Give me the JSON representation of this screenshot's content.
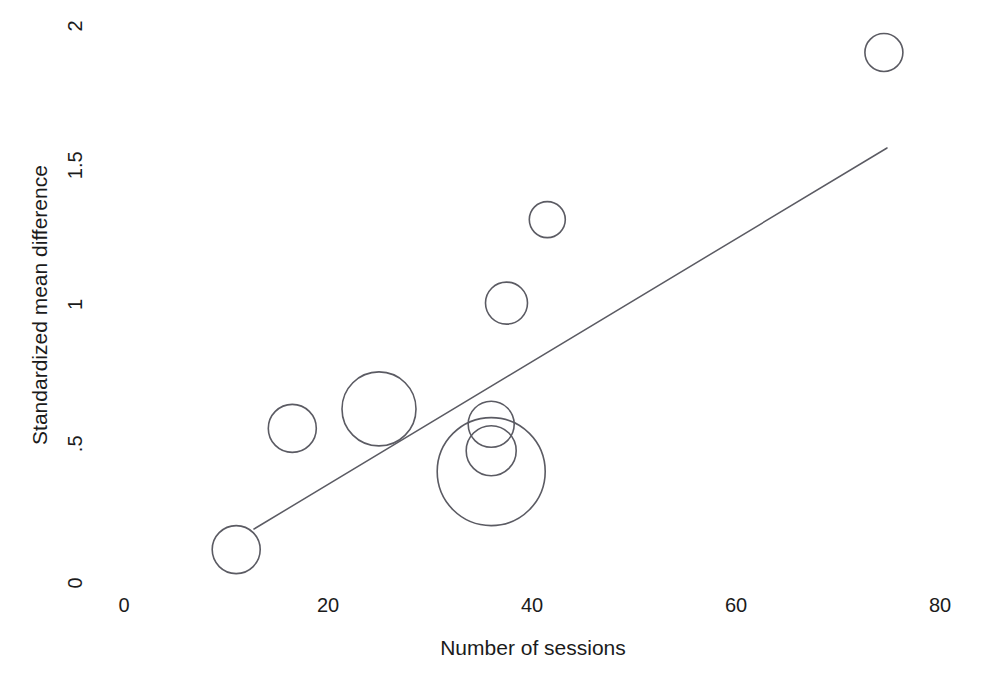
{
  "chart_data": {
    "type": "scatter",
    "title": "",
    "subtitle": "",
    "xlabel": "Number of sessions",
    "ylabel": "Standardized mean difference",
    "xlim": [
      0,
      80
    ],
    "ylim": [
      0,
      2
    ],
    "xticks": [
      0,
      20,
      40,
      60,
      80
    ],
    "xticklabels": [
      "0",
      "20",
      "40",
      "60",
      "80"
    ],
    "yticks": [
      0,
      0.5,
      1,
      1.5,
      2
    ],
    "yticklabels": [
      "0",
      ".5",
      "1",
      "1.5",
      "2"
    ],
    "grid": false,
    "legend": false,
    "legend_position": "none",
    "marker_style": "open-circle",
    "size_encodes": "study weight",
    "points": [
      {
        "x": 11,
        "y": 0.12,
        "size": 24,
        "label": "study-1"
      },
      {
        "x": 16.5,
        "y": 0.555,
        "size": 24,
        "label": "study-2"
      },
      {
        "x": 25,
        "y": 0.625,
        "size": 37,
        "label": "study-3"
      },
      {
        "x": 36,
        "y": 0.4,
        "size": 54,
        "label": "study-4"
      },
      {
        "x": 36,
        "y": 0.475,
        "size": 25,
        "label": "study-5"
      },
      {
        "x": 36,
        "y": 0.57,
        "size": 23,
        "label": "study-6"
      },
      {
        "x": 37.5,
        "y": 1.005,
        "size": 21,
        "label": "study-7"
      },
      {
        "x": 41.5,
        "y": 1.305,
        "size": 18,
        "label": "study-8"
      },
      {
        "x": 74.5,
        "y": 1.905,
        "size": 19,
        "label": "study-9"
      }
    ],
    "fit_line": {
      "name": "fitted regression line",
      "x_start": 12.75,
      "y_start": 0.194,
      "x_end": 74.8,
      "y_end": 1.562
    }
  },
  "axes": {
    "x_title": "Number of sessions",
    "y_title": "Standardized mean difference"
  },
  "colors": {
    "background": "#ffffff",
    "ink": "#1b1b1b",
    "marker_stroke": "#5b5b63",
    "line_stroke": "#5b5b63"
  }
}
